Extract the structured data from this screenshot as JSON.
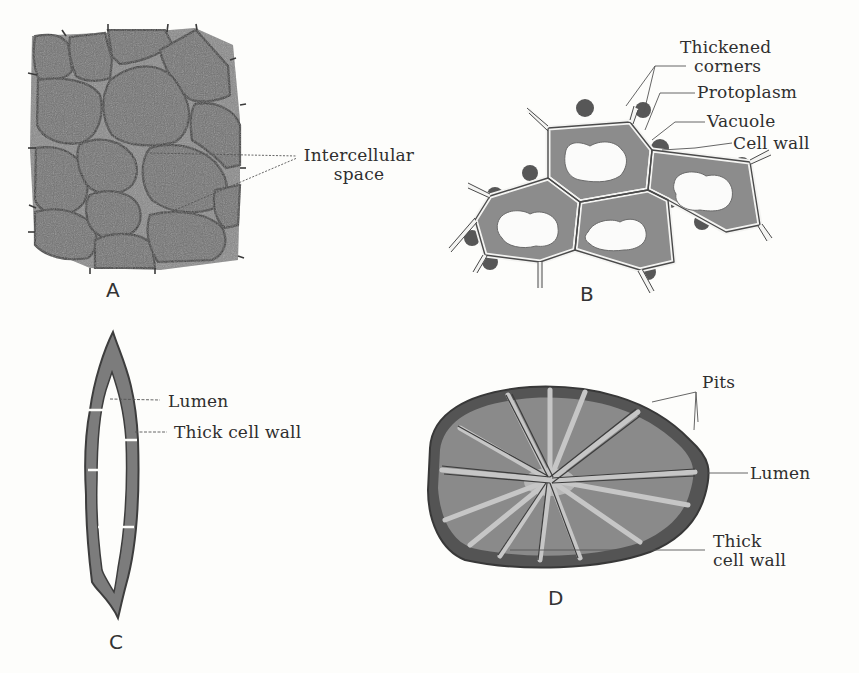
{
  "diagram": {
    "colors": {
      "background": "#fdfdfb",
      "cell_fill": "#7a7a7a",
      "cell_outline": "#3a3a3a",
      "wall_dark": "#4a4a4a",
      "lumen_light": "#a8a8a8",
      "text": "#2f2f2f"
    },
    "panels": [
      {
        "id": "A",
        "letter": "A",
        "labels": [
          {
            "line1": "Intercellular",
            "line2": "space"
          }
        ]
      },
      {
        "id": "B",
        "letter": "B",
        "labels": [
          {
            "line1": "Thickened",
            "line2": "corners"
          },
          {
            "text": "Protoplasm"
          },
          {
            "text": "Vacuole"
          },
          {
            "text": "Cell wall"
          }
        ]
      },
      {
        "id": "C",
        "letter": "C",
        "labels": [
          {
            "text": "Lumen"
          },
          {
            "text": "Thick cell wall"
          }
        ]
      },
      {
        "id": "D",
        "letter": "D",
        "labels": [
          {
            "text": "Pits"
          },
          {
            "text": "Lumen"
          },
          {
            "line1": "Thick",
            "line2": "cell wall"
          }
        ]
      }
    ]
  }
}
